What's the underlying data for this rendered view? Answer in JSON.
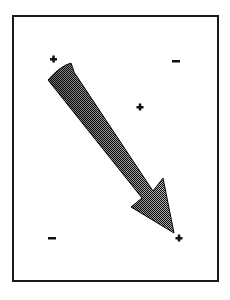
{
  "diagram": {
    "frame": {
      "x": 13,
      "y": 16,
      "width": 205,
      "height": 265,
      "stroke": "#1a1a1a"
    },
    "markers": [
      {
        "id": "top-left",
        "symbol": "+",
        "x": 53,
        "y": 59
      },
      {
        "id": "top-right",
        "symbol": "-",
        "x": 176,
        "y": 61
      },
      {
        "id": "center",
        "symbol": "+",
        "x": 140,
        "y": 107
      },
      {
        "id": "bottom-left",
        "symbol": "-",
        "x": 52,
        "y": 238
      },
      {
        "id": "bottom-right",
        "symbol": "+",
        "x": 179,
        "y": 238
      }
    ],
    "arrow": {
      "from": "top-left",
      "to": "bottom-right",
      "fill_dark": "#111111",
      "fill_light": "#8a8a8a"
    }
  }
}
